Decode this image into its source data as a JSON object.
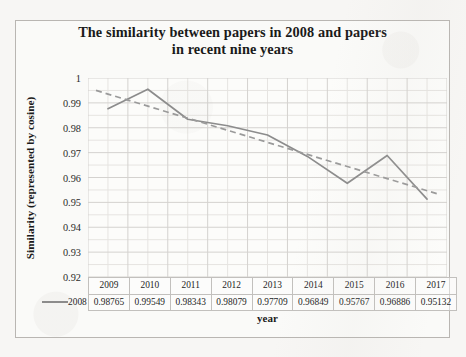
{
  "chart_data": {
    "type": "line",
    "title": "The similarity between papers in 2008 and papers in recent nine years",
    "title_line1": "The similarity between papers in 2008 and papers",
    "title_line2": "in recent nine years",
    "xlabel": "year",
    "ylabel": "Similarity (represented by cosine)",
    "categories": [
      "2009",
      "2010",
      "2011",
      "2012",
      "2013",
      "2014",
      "2015",
      "2016",
      "2017"
    ],
    "series": [
      {
        "name": "2008",
        "values": [
          0.98765,
          0.99549,
          0.98343,
          0.98079,
          0.97709,
          0.96849,
          0.95767,
          0.96886,
          0.95132
        ],
        "value_labels": [
          "0.98765",
          "0.99549",
          "0.98343",
          "0.98079",
          "0.97709",
          "0.96849",
          "0.95767",
          "0.96886",
          "0.95132"
        ],
        "style": "solid",
        "color": "#8c8c8c"
      },
      {
        "name": "trendline",
        "type": "linear-trendline",
        "values": [
          0.99355,
          0.98869,
          0.98384,
          0.97898,
          0.97413,
          0.96927,
          0.96442,
          0.95956,
          0.95471
        ],
        "style": "dashed",
        "color": "#9a9a9a"
      }
    ],
    "ylim": [
      0.92,
      1.0
    ],
    "yticks": [
      1,
      0.99,
      0.98,
      0.97,
      0.96,
      0.95,
      0.94,
      0.93,
      0.92
    ],
    "ytick_labels": [
      "1",
      "0.99",
      "0.98",
      "0.97",
      "0.96",
      "0.95",
      "0.94",
      "0.93",
      "0.92"
    ],
    "grid": true,
    "minor_grid": true,
    "legend_position": "data-table-row",
    "data_table_visible": true,
    "markers": false,
    "colors": {
      "series_line": "#8c8c8c",
      "trendline": "#9a9a9a",
      "major_gridline": "#d4d2cf",
      "minor_gridline": "#e6e4e1",
      "plot_background": "#fdfdfc",
      "frame_border": "#b9b6b2",
      "table_border": "#c2c0bd",
      "text": "#1a1a1a"
    }
  },
  "table": {
    "legend_label": "2008",
    "header_row": [
      "2009",
      "2010",
      "2011",
      "2012",
      "2013",
      "2014",
      "2015",
      "2016",
      "2017"
    ],
    "value_row": [
      "0.98765",
      "0.99549",
      "0.98343",
      "0.98079",
      "0.97709",
      "0.96849",
      "0.95767",
      "0.96886",
      "0.95132"
    ]
  }
}
